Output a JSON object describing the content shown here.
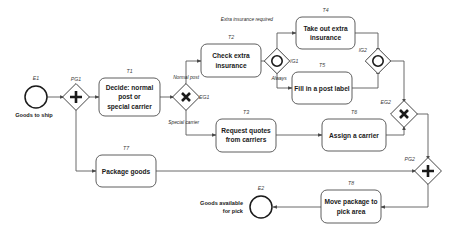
{
  "diagram": {
    "type": "bpmn-process",
    "events": [
      {
        "id": "E1",
        "label": "Goods to ship",
        "kind": "start-event"
      },
      {
        "id": "E2",
        "label": "Goods available for pick",
        "kind": "end-event"
      }
    ],
    "gateways": [
      {
        "id": "PG1",
        "kind": "parallel-gateway",
        "symbol": "+"
      },
      {
        "id": "EG1",
        "kind": "exclusive-gateway",
        "symbol": "X"
      },
      {
        "id": "IG1",
        "kind": "inclusive-gateway",
        "symbol": "O"
      },
      {
        "id": "IG2",
        "kind": "inclusive-gateway",
        "symbol": "O"
      },
      {
        "id": "EG2",
        "kind": "exclusive-gateway",
        "symbol": "X"
      },
      {
        "id": "PG2",
        "kind": "parallel-gateway",
        "symbol": "+"
      }
    ],
    "tasks": [
      {
        "id": "T1",
        "label": "Decide: normal post or special carrier"
      },
      {
        "id": "T2",
        "label": "Check extra insurance"
      },
      {
        "id": "T3",
        "label": "Request quotes from carriers"
      },
      {
        "id": "T4",
        "label": "Take out extra insurance"
      },
      {
        "id": "T5",
        "label": "Fill in a post label"
      },
      {
        "id": "T6",
        "label": "Assign a carrier"
      },
      {
        "id": "T7",
        "label": "Package goods"
      },
      {
        "id": "T8",
        "label": "Move package to pick area"
      }
    ],
    "flow_labels": {
      "normal_post": "Normal post",
      "special_carrier": "Special carrier",
      "extra_insurance_required": "Extra insurance required",
      "always": "Always"
    },
    "task_lines": {
      "T1": [
        "Decide: normal",
        "post or",
        "special carrier"
      ],
      "T2": [
        "Check extra",
        "insurance"
      ],
      "T3": [
        "Request quotes",
        "from carriers"
      ],
      "T4": [
        "Take out extra",
        "insurance"
      ],
      "T5": [
        "Fill in a post label"
      ],
      "T6": [
        "Assign a carrier"
      ],
      "T7": [
        "Package goods"
      ],
      "T8": [
        "Move package to",
        "pick area"
      ]
    },
    "event_lines": {
      "E1": [
        "Goods to ship"
      ],
      "E2": [
        "Goods available",
        "for pick"
      ]
    },
    "colors": {
      "stroke": "#4d4d4d",
      "flow": "#5a5a5a",
      "text": "#1a1a1a",
      "background": "#ffffff"
    }
  }
}
